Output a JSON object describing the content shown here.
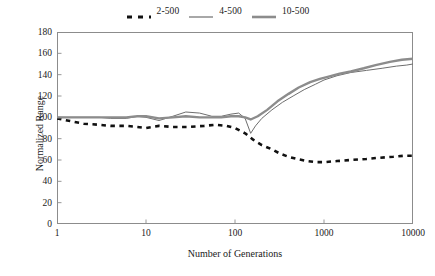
{
  "chart_data": {
    "type": "line",
    "title": "",
    "xlabel": "Number of Generations",
    "ylabel": "Normalized Range",
    "xscale": "log",
    "xlim": [
      1,
      10000
    ],
    "ylim": [
      0,
      180
    ],
    "xticks": [
      "1",
      "10",
      "100",
      "1000",
      "10000"
    ],
    "yticks": [
      "0",
      "20",
      "40",
      "60",
      "80",
      "100",
      "120",
      "140",
      "160",
      "180"
    ],
    "grid": false,
    "legend_position": "top-center",
    "series": [
      {
        "name": "2-500",
        "style": "dashed",
        "color": "#111111",
        "width": 2.6,
        "x": [
          1,
          1.5,
          2,
          3,
          4,
          6,
          8,
          10,
          14,
          20,
          30,
          45,
          60,
          80,
          100,
          130,
          160,
          200,
          260,
          320,
          400,
          500,
          650,
          800,
          1000,
          1400,
          2000,
          3000,
          4000,
          6000,
          8000,
          10000
        ],
        "y": [
          99,
          96,
          94,
          93,
          92,
          92,
          91,
          90,
          92,
          91,
          91,
          92,
          93,
          92,
          90,
          85,
          79,
          74,
          70,
          66,
          63,
          61,
          59,
          58,
          58,
          59,
          60,
          61,
          62,
          63,
          64,
          64
        ]
      },
      {
        "name": "4-500",
        "style": "solid",
        "color": "#6e6e6e",
        "width": 1.0,
        "x": [
          1,
          2,
          3,
          4,
          6,
          8,
          10,
          14,
          20,
          28,
          40,
          55,
          70,
          90,
          110,
          130,
          150,
          170,
          200,
          260,
          340,
          450,
          600,
          800,
          1000,
          1400,
          2000,
          3000,
          4500,
          6500,
          8500,
          10000
        ],
        "y": [
          100,
          100,
          100,
          99,
          99,
          101,
          100,
          97,
          101,
          105,
          104,
          101,
          101,
          103,
          104,
          99,
          85,
          92,
          99,
          107,
          114,
          120,
          126,
          131,
          135,
          139,
          142,
          144,
          146,
          148,
          149,
          150
        ]
      },
      {
        "name": "10-500",
        "style": "solid",
        "color": "#8c8c8c",
        "width": 2.4,
        "x": [
          1,
          2,
          3,
          4,
          6,
          8,
          10,
          14,
          20,
          28,
          40,
          55,
          70,
          90,
          110,
          130,
          150,
          180,
          230,
          300,
          400,
          520,
          700,
          900,
          1100,
          1500,
          2000,
          2800,
          3800,
          5500,
          7500,
          10000
        ],
        "y": [
          100,
          100,
          100,
          100,
          100,
          101,
          101,
          99,
          100,
          101,
          100,
          100,
          100,
          101,
          101,
          100,
          98,
          101,
          107,
          115,
          122,
          128,
          133,
          136,
          138,
          141,
          143,
          146,
          149,
          152,
          154,
          155
        ]
      }
    ]
  },
  "legend": {
    "entries": [
      {
        "label": "2-500"
      },
      {
        "label": "4-500"
      },
      {
        "label": "10-500"
      }
    ]
  }
}
